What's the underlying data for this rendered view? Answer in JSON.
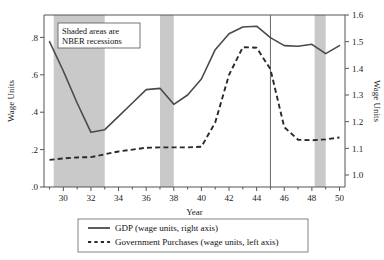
{
  "chart_data": {
    "type": "line",
    "title": "",
    "xlabel": "Year",
    "ylabel_left": "Wage Units",
    "ylabel_right": "Wage Units",
    "xlim": [
      28.6,
      50.4
    ],
    "ylim_left": [
      0.0,
      0.92
    ],
    "ylim_right": [
      0.955,
      1.6
    ],
    "grid": false,
    "legend_position": "bottom",
    "x_ticks_major": [
      30,
      32,
      34,
      36,
      38,
      40,
      42,
      44,
      46,
      48,
      50
    ],
    "x_ticks_minor": [
      29,
      31,
      33,
      35,
      37,
      39,
      41,
      43,
      45,
      47,
      49
    ],
    "y_ticks_left": [
      ".0",
      ".2",
      ".4",
      ".6",
      ".8"
    ],
    "y_ticks_left_values": [
      0.0,
      0.2,
      0.4,
      0.6,
      0.8
    ],
    "y_ticks_right": [
      "1.0",
      "1.1",
      "1.2",
      "1.3",
      "1.4",
      "1.5",
      "1.6"
    ],
    "y_ticks_right_values": [
      1.0,
      1.1,
      1.2,
      1.3,
      1.4,
      1.5,
      1.6
    ],
    "annotation": {
      "line1": "Shaded areas are",
      "line2": "NBER recessions"
    },
    "shaded_bands_label": "NBER recessions",
    "shaded_bands": [
      {
        "start": 29.3,
        "end": 33.0
      },
      {
        "start": 37.0,
        "end": 38.0
      },
      {
        "start": 48.2,
        "end": 49.0
      }
    ],
    "vertical_line_year": 45,
    "series": [
      {
        "name": "GDP (wage units, right axis)",
        "axis": "right",
        "style": "solid",
        "color": "#4a4a4a",
        "x": [
          29,
          30,
          31,
          32,
          33,
          34,
          35,
          36,
          37,
          38,
          39,
          40,
          41,
          42,
          43,
          44,
          45,
          46,
          47,
          48,
          49,
          50
        ],
        "values": [
          1.5,
          1.39,
          1.27,
          1.16,
          1.17,
          1.22,
          1.27,
          1.32,
          1.325,
          1.265,
          1.3,
          1.36,
          1.47,
          1.53,
          1.555,
          1.558,
          1.515,
          1.485,
          1.483,
          1.49,
          1.455,
          1.485
        ]
      },
      {
        "name": "Government Purchases (wage units, left axis)",
        "axis": "left",
        "style": "dashed",
        "color": "#2a2a2a",
        "x": [
          29,
          30,
          31,
          32,
          33,
          34,
          35,
          36,
          37,
          38,
          39,
          40,
          41,
          42,
          43,
          44,
          45,
          46,
          47,
          48,
          49,
          50
        ],
        "values": [
          0.145,
          0.153,
          0.158,
          0.16,
          0.175,
          0.19,
          0.2,
          0.21,
          0.212,
          0.212,
          0.212,
          0.215,
          0.345,
          0.6,
          0.748,
          0.745,
          0.63,
          0.32,
          0.253,
          0.25,
          0.255,
          0.265
        ]
      }
    ],
    "legend": [
      {
        "label": "GDP (wage units, right axis)",
        "style": "solid"
      },
      {
        "label": "Government Purchases (wage units, left axis)",
        "style": "dashed"
      }
    ]
  }
}
